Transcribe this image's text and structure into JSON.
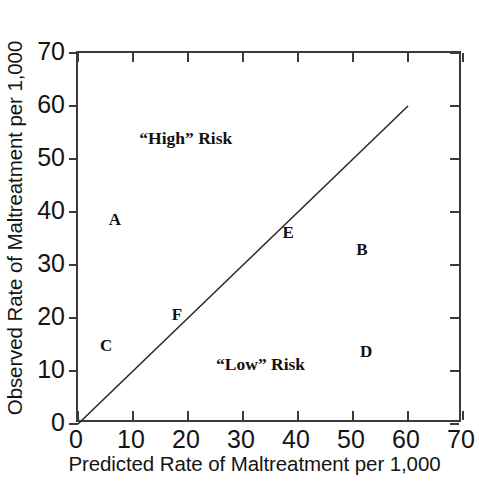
{
  "chart_data": {
    "type": "scatter",
    "title": "",
    "xlabel": "Predicted Rate of Maltreatment per 1,000",
    "ylabel": "Observed Rate of Maltreatment per 1,000",
    "xlim": [
      0,
      70
    ],
    "ylim": [
      0,
      70
    ],
    "xticks": [
      0,
      10,
      20,
      30,
      40,
      50,
      60,
      70
    ],
    "yticks": [
      0,
      10,
      20,
      30,
      40,
      50,
      60,
      70
    ],
    "xtick_labels": [
      "0",
      "10",
      "20",
      "30",
      "40",
      "50",
      "60",
      "70"
    ],
    "ytick_labels": [
      "0",
      "10",
      "20",
      "30",
      "40",
      "50",
      "60",
      "70"
    ],
    "grid": false,
    "legend": null,
    "points": [
      {
        "label": "A",
        "x": 6.7,
        "y": 38.5
      },
      {
        "label": "B",
        "x": 51.6,
        "y": 32.8
      },
      {
        "label": "C",
        "x": 5.1,
        "y": 14.7
      },
      {
        "label": "D",
        "x": 52.4,
        "y": 13.6
      },
      {
        "label": "E",
        "x": 38.2,
        "y": 36.0
      },
      {
        "label": "F",
        "x": 18.0,
        "y": 20.6
      }
    ],
    "reference_line": {
      "name": "identity-line",
      "x_start": 0,
      "y_start": 0,
      "x_end": 60,
      "y_end": 60
    },
    "annotations": [
      {
        "text": "“High” Risk",
        "x": 19.6,
        "y": 54.0
      },
      {
        "text": "“Low” Risk",
        "x": 33.2,
        "y": 11.4
      }
    ]
  },
  "colors": {
    "axis": "#3a3a3a",
    "text": "#151515",
    "marker_text": "#111111",
    "background": "#ffffff"
  }
}
